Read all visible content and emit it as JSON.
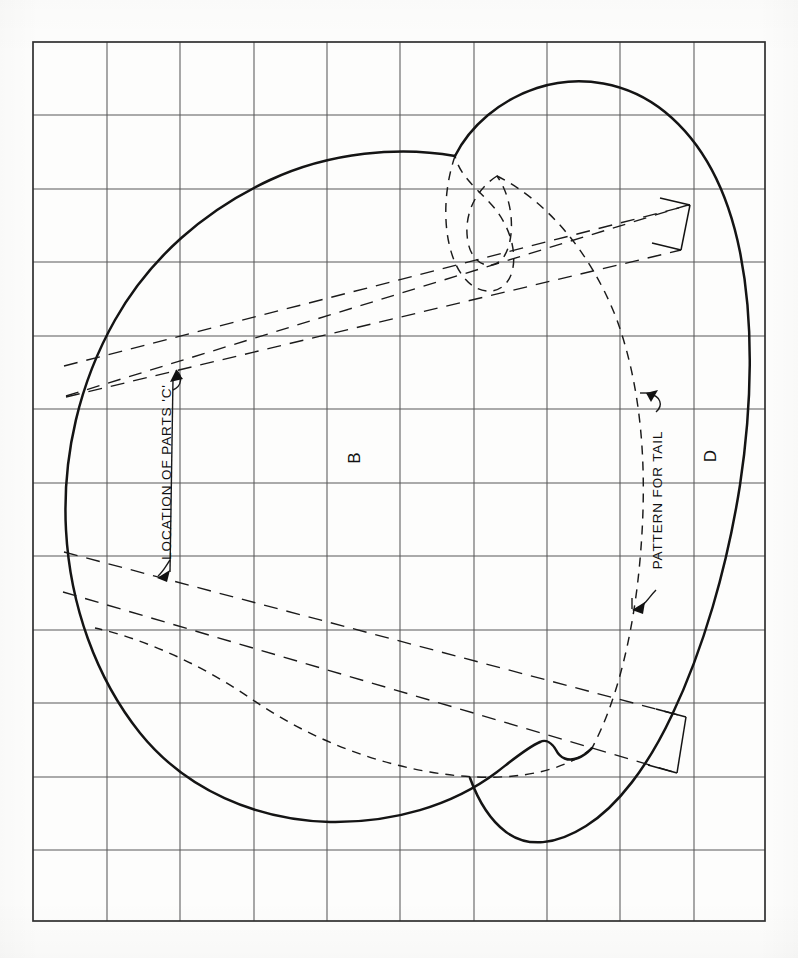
{
  "document": {
    "type": "pattern-drawing",
    "title": "Apple body and tail pattern on scale grid",
    "background_color": "#fdfdfc",
    "ink_color": "#1a1a1a",
    "grid_color": "#555555"
  },
  "grid": {
    "left": 33,
    "top": 42,
    "right": 765,
    "bottom": 921,
    "columns": 10,
    "rows": 12,
    "cell_width": 73.2,
    "cell_height": 73.25,
    "line_color": "#565656",
    "border_color": "#2b2b2b",
    "line_width": 1.1,
    "border_width": 1.6
  },
  "annotations": [
    {
      "id": "location-of-parts-c",
      "text": "LOCATION OF PARTS 'C'",
      "rotation": -90,
      "x": 171,
      "y": 472,
      "font_size": 13,
      "arrows": 2,
      "arrow_directions": [
        "up",
        "down"
      ]
    },
    {
      "id": "pattern-for-tail",
      "text": "PATTERN FOR TAIL",
      "rotation": -90,
      "x": 660,
      "y": 498,
      "font_size": 13,
      "arrows": 2,
      "arrow_directions": [
        "up",
        "down"
      ]
    },
    {
      "id": "part-label-b",
      "text": "B",
      "rotation": -90,
      "x": 360,
      "y": 458,
      "font_size": 17
    },
    {
      "id": "part-label-d",
      "text": "D",
      "rotation": -90,
      "x": 715,
      "y": 455,
      "font_size": 17
    }
  ],
  "shapes": {
    "body_outline_b": {
      "style": "solid",
      "stroke_width": 2.4,
      "description": "Large apple body outline, left lobe"
    },
    "right_lobe_d": {
      "style": "solid",
      "stroke_width": 2.4,
      "description": "Right lobe outline labelled D"
    },
    "tail_pattern": {
      "style": "dashed",
      "stroke_width": 1.4,
      "dash": "9 7",
      "description": "Dashed tail pattern hook and long tail curve"
    },
    "band_upper": {
      "style": "dashed-with-solid-end",
      "stroke_width": 1.3,
      "dash": "12 8",
      "description": "Upper parts-C locating band, terminating in solid rectangle at right"
    },
    "band_lower": {
      "style": "dashed-with-solid-end",
      "stroke_width": 1.3,
      "dash": "12 8",
      "description": "Lower parts-C locating band, terminating in solid rectangle at right"
    }
  }
}
